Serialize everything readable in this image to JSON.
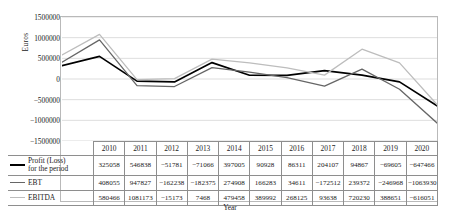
{
  "axis": {
    "ylabel": "Euros",
    "xlabel": "Year",
    "yticks": [
      "1500000",
      "1000000",
      "500000",
      "0",
      "-500000",
      "-1000000",
      "-1500000"
    ]
  },
  "legend": {
    "profit": "Profit (Loss) for the period",
    "profit_line1": "Profit (Loss)",
    "profit_line2": "for the period",
    "ebt": "EBT",
    "ebitda": "EBITDA"
  },
  "colors": {
    "profit": "#000000",
    "ebt": "#666666",
    "ebitda": "#bdbdbd",
    "grid": "#d4d4d4",
    "border": "#b9b9b9",
    "table_border": "#8e8e8e"
  },
  "chart_data": {
    "type": "line",
    "title": "",
    "xlabel": "Year",
    "ylabel": "Euros",
    "ylim": [
      -1500000,
      1500000
    ],
    "ytick_step": 500000,
    "grid": true,
    "legend_position": "table-left",
    "categories": [
      "2010",
      "2011",
      "2012",
      "2013",
      "2014",
      "2015",
      "2016",
      "2017",
      "2018",
      "2019",
      "2020"
    ],
    "series": [
      {
        "name": "Profit (Loss) for the period",
        "color": "#000000",
        "values": [
          325058,
          546838,
          -51781,
          -71066,
          397005,
          90928,
          86311,
          204107,
          94867,
          -69605,
          -647466
        ]
      },
      {
        "name": "EBT",
        "color": "#666666",
        "values": [
          408055,
          947827,
          -162238,
          -182375,
          274908,
          166283,
          34611,
          -172512,
          239372,
          -246968,
          -1063930
        ]
      },
      {
        "name": "EBITDA",
        "color": "#bdbdbd",
        "values": [
          580466,
          1081173,
          -15173,
          7468,
          479458,
          389992,
          268125,
          93638,
          720230,
          388651,
          -616051
        ]
      }
    ]
  }
}
